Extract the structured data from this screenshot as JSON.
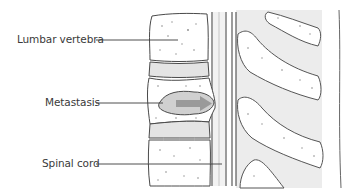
{
  "diagram": {
    "type": "anatomical-illustration",
    "labels": [
      {
        "id": "lumbar-vertebra",
        "text": "Lumbar vertebra",
        "x": 17,
        "y": 33,
        "leader": {
          "x1": 96,
          "y1": 40,
          "x2": 178,
          "y2": 40
        }
      },
      {
        "id": "metastasis",
        "text": "Metastasis",
        "x": 45,
        "y": 96,
        "leader": {
          "x1": 96,
          "y1": 103,
          "x2": 163,
          "y2": 103
        }
      },
      {
        "id": "spinal-cord",
        "text": "Spinal cord",
        "x": 42,
        "y": 157,
        "leader": {
          "x1": 96,
          "y1": 164,
          "x2": 222,
          "y2": 164
        }
      }
    ],
    "colors": {
      "outline": "#4a4a4a",
      "bone_fill": "#ffffff",
      "disc_fill": "#e4e4e4",
      "soft_tissue": "#ececec",
      "metastasis_fill": "#d0d0d0",
      "arrow": "#9a9a9a",
      "label_text": "#3a3a3a"
    }
  }
}
